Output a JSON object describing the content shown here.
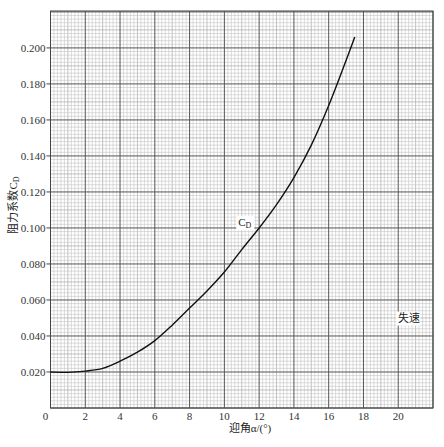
{
  "chart_data": {
    "type": "line",
    "title": "",
    "xlabel": "迎角α/(°)",
    "ylabel": "阻力系数C_D",
    "xlim": [
      0,
      22
    ],
    "ylim": [
      0,
      0.2205
    ],
    "xticks": [
      0,
      2,
      4,
      6,
      8,
      10,
      12,
      14,
      16,
      18,
      20
    ],
    "xtick_labels": [
      "0",
      "2",
      "4",
      "6",
      "8",
      "10",
      "12",
      "14",
      "16",
      "18",
      "20"
    ],
    "yticks": [
      0.02,
      0.04,
      0.06,
      0.08,
      0.1,
      0.12,
      0.14,
      0.16,
      0.18,
      0.2
    ],
    "ytick_labels": [
      "0.020",
      "0.040",
      "0.060",
      "0.080",
      "0.100",
      "0.120",
      "0.140",
      "0.160",
      "0.180",
      "0.200"
    ],
    "grid": true,
    "grid_style": "graph paper: major every 2° / 0.020, 10 minor subdivisions",
    "series": [
      {
        "name": "C_D",
        "x": [
          0,
          1,
          2,
          3,
          4,
          5,
          6,
          7,
          8,
          9,
          10,
          11,
          12,
          13,
          14,
          15,
          16,
          17,
          17.5
        ],
        "values": [
          0.02,
          0.0198,
          0.0205,
          0.022,
          0.026,
          0.031,
          0.0374,
          0.046,
          0.0555,
          0.065,
          0.0755,
          0.088,
          0.1,
          0.113,
          0.128,
          0.146,
          0.168,
          0.193,
          0.206
        ]
      }
    ],
    "annotations": [
      {
        "text": "C_D",
        "x": 10.8,
        "y": 0.101
      },
      {
        "text": "失速",
        "x": 20.0,
        "y": 0.048
      }
    ]
  }
}
